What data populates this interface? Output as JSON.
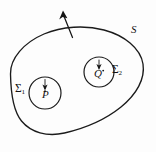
{
  "figure": {
    "kind": "mathematical-diagram",
    "background_color": "#fdfdfd",
    "ink_color": "#1b1b1b"
  },
  "labels": {
    "outer_surface": "S",
    "inner_surface_1": "Σ",
    "inner_surface_1_sub": "1",
    "inner_surface_2": "Σ",
    "inner_surface_2_sub": "2",
    "point_p": "P",
    "point_q": "Q"
  },
  "shapes": {
    "outer_boundary": {
      "name": "S",
      "type": "ellipse",
      "cx": 76,
      "cy": 80,
      "rx": 68,
      "ry": 55
    },
    "inner_circle_1": {
      "name": "Σ₁",
      "type": "circle",
      "cx": 45,
      "cy": 93,
      "r": 16
    },
    "inner_circle_2": {
      "name": "Σ₂",
      "type": "circle",
      "cx": 99,
      "cy": 72,
      "r": 15
    }
  },
  "arrows": {
    "outer_normal": {
      "name": "outward-normal-S",
      "from_x": 72,
      "from_y": 36,
      "to_x": 63,
      "to_y": 12
    },
    "normal_p": {
      "name": "normal-sigma1",
      "from_x": 45,
      "from_y": 79,
      "to_x": 45,
      "to_y": 89
    },
    "normal_q": {
      "name": "normal-sigma2",
      "from_x": 99,
      "from_y": 60,
      "to_x": 99,
      "to_y": 69
    }
  },
  "points": {
    "p": {
      "cx": 45,
      "cy": 93
    },
    "q": {
      "cx": 99,
      "cy": 72
    }
  }
}
